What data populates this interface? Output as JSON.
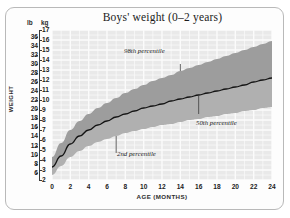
{
  "figure": {
    "title": "Boys' weight (0–2 years)",
    "background_color": "#ffffff",
    "frame_color": "#b9b9b9"
  },
  "axes": {
    "y_axis_label": "WEIGHT",
    "x_axis_label": "AGE (MONTHS)",
    "unit_left": "lb",
    "unit_right": "kg",
    "lb_ticks": [
      "36",
      "34",
      "32",
      "30",
      "28",
      "26",
      "24",
      "22",
      "20",
      "18",
      "16",
      "14",
      "12",
      "10",
      "8",
      "6"
    ],
    "kg_ticks": [
      "17",
      "16",
      "15",
      "14",
      "13",
      "12",
      "11",
      "10",
      "9",
      "8",
      "7",
      "6",
      "5",
      "4",
      "3",
      "2"
    ],
    "x_ticks": [
      "0",
      "2",
      "4",
      "6",
      "8",
      "10",
      "12",
      "14",
      "16",
      "18",
      "20",
      "22",
      "24"
    ]
  },
  "annotations": {
    "p98": "98th percentile",
    "p50": "50th percentile",
    "p2": "2nd percentile"
  },
  "colors": {
    "plot_background": "#e9e9e9",
    "grid_line": "#fbfbfb",
    "band_fill": "#a5a5a5",
    "median_line": "#1a1a1a",
    "axis": "#3a3a3a"
  },
  "chart_data": {
    "type": "line",
    "title": "Boys' weight (0–2 years)",
    "xlabel": "AGE (MONTHS)",
    "ylabel": "WEIGHT",
    "xlim": [
      0,
      24
    ],
    "ylim_kg": [
      2,
      17
    ],
    "ylim_lb": [
      4.4,
      37.5
    ],
    "grid": true,
    "legend_position": "inline-annotations",
    "x_unit": "months",
    "y_unit_primary": "kg",
    "y_unit_secondary": "lb",
    "x": [
      0,
      1,
      2,
      3,
      4,
      5,
      6,
      7,
      8,
      9,
      10,
      11,
      12,
      13,
      14,
      15,
      16,
      17,
      18,
      19,
      20,
      21,
      22,
      23,
      24
    ],
    "series": [
      {
        "name": "98th percentile",
        "unit": "kg",
        "values": [
          4.3,
          5.7,
          7.0,
          7.9,
          8.6,
          9.2,
          9.7,
          10.2,
          10.7,
          11.1,
          11.5,
          11.9,
          12.2,
          12.5,
          12.9,
          13.2,
          13.5,
          13.8,
          14.1,
          14.4,
          14.7,
          15.0,
          15.3,
          15.6,
          15.9
        ]
      },
      {
        "name": "50th percentile",
        "unit": "kg",
        "values": [
          3.3,
          4.4,
          5.6,
          6.4,
          7.0,
          7.5,
          7.9,
          8.3,
          8.6,
          8.9,
          9.2,
          9.4,
          9.6,
          9.9,
          10.1,
          10.3,
          10.5,
          10.7,
          10.9,
          11.1,
          11.3,
          11.5,
          11.8,
          12.0,
          12.2
        ]
      },
      {
        "name": "2nd percentile",
        "unit": "kg",
        "values": [
          2.5,
          3.4,
          4.3,
          4.9,
          5.4,
          5.8,
          6.1,
          6.4,
          6.7,
          6.9,
          7.1,
          7.3,
          7.5,
          7.6,
          7.8,
          8.0,
          8.1,
          8.3,
          8.4,
          8.6,
          8.7,
          8.9,
          9.0,
          9.2,
          9.3
        ]
      }
    ]
  }
}
